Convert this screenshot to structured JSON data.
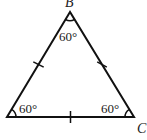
{
  "diagram": {
    "type": "equilateral-triangle",
    "stroke_color": "#111111",
    "vertices": {
      "top": {
        "label": "B",
        "angle": "60°"
      },
      "bottom_left": {
        "label": "",
        "angle": "60°"
      },
      "bottom_right": {
        "label": "C",
        "angle": "60°"
      }
    },
    "sides": {
      "left": {
        "tick_marks": 1
      },
      "right": {
        "tick_marks": 1
      },
      "bottom": {
        "tick_marks": 1
      }
    }
  }
}
